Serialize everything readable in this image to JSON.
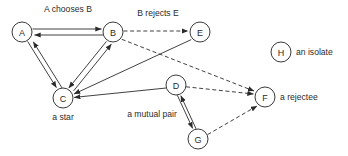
{
  "diagram": {
    "width": 348,
    "height": 156,
    "background_color": "#ffffff",
    "stroke_color": "#2b2b2b",
    "node_radius": 10
  },
  "nodes": [
    {
      "id": "A",
      "label": "A",
      "x": 22,
      "y": 32
    },
    {
      "id": "B",
      "label": "B",
      "x": 113,
      "y": 32
    },
    {
      "id": "E",
      "label": "E",
      "x": 200,
      "y": 32
    },
    {
      "id": "C",
      "label": "C",
      "x": 63,
      "y": 98
    },
    {
      "id": "D",
      "label": "D",
      "x": 176,
      "y": 85
    },
    {
      "id": "G",
      "label": "G",
      "x": 198,
      "y": 139
    },
    {
      "id": "F",
      "label": "F",
      "x": 265,
      "y": 97
    },
    {
      "id": "H",
      "label": "H",
      "x": 281,
      "y": 52
    }
  ],
  "edges": [
    {
      "id": "a-b",
      "from": "A",
      "to": "B",
      "style": "solid",
      "kind": "mutual",
      "label": "A chooses B"
    },
    {
      "id": "a-c",
      "from": "A",
      "to": "C",
      "style": "solid",
      "kind": "mutual",
      "label": ""
    },
    {
      "id": "b-c",
      "from": "B",
      "to": "C",
      "style": "solid",
      "kind": "mutual",
      "label": ""
    },
    {
      "id": "b-e",
      "from": "B",
      "to": "E",
      "style": "dashed",
      "kind": "single",
      "label": "B rejects E"
    },
    {
      "id": "b-f",
      "from": "B",
      "to": "F",
      "style": "dashed",
      "kind": "single",
      "label": ""
    },
    {
      "id": "e-c",
      "from": "E",
      "to": "C",
      "style": "solid",
      "kind": "single",
      "label": ""
    },
    {
      "id": "d-c",
      "from": "D",
      "to": "C",
      "style": "solid",
      "kind": "single",
      "label": ""
    },
    {
      "id": "d-g",
      "from": "D",
      "to": "G",
      "style": "solid",
      "kind": "mutual",
      "label": "a mutual pair"
    },
    {
      "id": "d-f",
      "from": "D",
      "to": "F",
      "style": "dashed",
      "kind": "single",
      "label": ""
    },
    {
      "id": "g-f",
      "from": "G",
      "to": "F",
      "style": "dashed",
      "kind": "single",
      "label": ""
    }
  ],
  "edge_labels": {
    "a_chooses_b": {
      "text": "A chooses B",
      "x": 68,
      "y": 12
    },
    "b_rejects_e": {
      "text": "B rejects E",
      "x": 158,
      "y": 16
    },
    "a_mutual_pair": {
      "text": "a mutual pair",
      "x": 152,
      "y": 117
    }
  },
  "annotations": {
    "a_star": {
      "text": "a star",
      "x": 63,
      "y": 120
    },
    "a_rejectee": {
      "text": "a rejectee",
      "x": 280,
      "y": 100
    },
    "an_isolate": {
      "text": "an isolate",
      "x": 296,
      "y": 55
    }
  }
}
